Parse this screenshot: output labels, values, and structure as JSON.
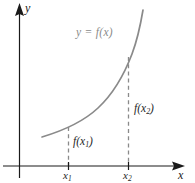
{
  "figure": {
    "title_alt": "Graph of an increasing function y = f(x) with values f(x1) and f(x2)",
    "background_color": "#ffffff",
    "axis_color": "#1a1a1a",
    "curve_color": "#8a8a8a",
    "dash_color": "#8a8a8a",
    "label_color": "#262626"
  },
  "axes": {
    "y_label": "y",
    "x_label": "x",
    "origin": {
      "x": 19.5,
      "y": 166
    },
    "y_axis": {
      "x": 19.5,
      "top": 3,
      "bottom": 178
    },
    "x_axis": {
      "y": 166,
      "left": 3,
      "right": 185
    }
  },
  "curve": {
    "label": "y = f(x)",
    "label_pos": {
      "x": 76,
      "y": 27
    },
    "start": {
      "x": 42,
      "y": 137
    },
    "end": {
      "x": 143,
      "y": 10
    },
    "path": "M 42 137 C 62 131, 82 123, 98 108 C 112 95, 124 75, 132 54 C 138 38, 141 22, 143 10"
  },
  "markers": [
    {
      "name": "x1",
      "tick_label": "x",
      "tick_sub": "1",
      "tick_x": 68.5,
      "tick_label_pos": {
        "x": 63,
        "y": 169
      },
      "value_label": "f(x",
      "value_sub": "1",
      "value_suffix": ")",
      "value_label_pos": {
        "x": 73,
        "y": 136
      },
      "dash_top": 127,
      "dash_bottom": 166
    },
    {
      "name": "x2",
      "tick_label": "x",
      "tick_sub": "2",
      "tick_x": 128.5,
      "tick_label_pos": {
        "x": 123,
        "y": 169
      },
      "value_label": "f(x",
      "value_sub": "2",
      "value_suffix": ")",
      "value_label_pos": {
        "x": 134,
        "y": 103
      },
      "dash_top": 57,
      "dash_bottom": 166
    }
  ],
  "chart_data": {
    "type": "line",
    "title": "",
    "subtitle": "",
    "xlabel": "x",
    "ylabel": "y",
    "annotations": [
      "y = f(x)",
      "f(x1)",
      "f(x2)",
      "x1",
      "x2"
    ],
    "legend": [],
    "grid": false,
    "x_tick_labels": [
      "x1",
      "x2"
    ],
    "y_tick_labels": [],
    "series": [
      {
        "name": "y = f(x)",
        "description": "increasing convex curve",
        "x": [
          0.28,
          0.45,
          0.62,
          0.78,
          0.9,
          1.0
        ],
        "y": [
          0.18,
          0.24,
          0.36,
          0.55,
          0.78,
          0.96
        ]
      }
    ],
    "marked_points": [
      {
        "label": "x1",
        "x": 0.4,
        "y": 0.24
      },
      {
        "label": "x2",
        "x": 0.76,
        "y": 0.66
      }
    ],
    "xlim": [
      0,
      1.1
    ],
    "ylim": [
      0,
      1.05
    ]
  }
}
